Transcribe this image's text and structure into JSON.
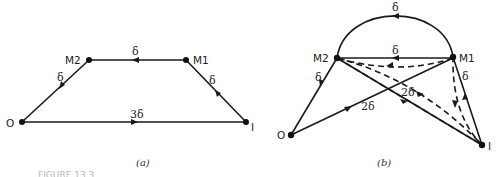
{
  "figure_caption_fragment": "FIGURE 13.3",
  "diagrams": [
    {
      "id": "a",
      "caption": "(a)",
      "nodes": {
        "M2": {
          "label": "M2"
        },
        "M1": {
          "label": "M1"
        },
        "O": {
          "label": "O"
        },
        "I": {
          "label": "I"
        }
      },
      "edges": [
        {
          "from": "M1",
          "to": "M2",
          "label": "δ",
          "style": "solid"
        },
        {
          "from": "M2",
          "to": "O",
          "label": "δ",
          "style": "solid"
        },
        {
          "from": "O",
          "to": "I",
          "label": "3δ",
          "style": "solid"
        },
        {
          "from": "I",
          "to": "M1",
          "label": "δ",
          "style": "solid"
        }
      ]
    },
    {
      "id": "b",
      "caption": "(b)",
      "nodes": {
        "M2": {
          "label": "M2"
        },
        "M1": {
          "label": "M1"
        },
        "O": {
          "label": "O"
        },
        "I": {
          "label": "I"
        }
      },
      "edges": [
        {
          "from": "M1",
          "to": "M2",
          "label": "δ",
          "style": "arc"
        },
        {
          "from": "M1",
          "to": "M2",
          "label": "δ",
          "style": "solid"
        },
        {
          "from": "M2",
          "to": "O",
          "label": "δ",
          "style": "solid"
        },
        {
          "from": "O",
          "to": "M1",
          "label": "2δ",
          "style": "solid"
        },
        {
          "from": "M2",
          "to": "I",
          "label": "2δ",
          "style": "solid"
        },
        {
          "from": "I",
          "to": "M1",
          "label": "δ",
          "style": "solid"
        },
        {
          "from": "M1",
          "to": "M2",
          "label": "",
          "style": "dashed"
        },
        {
          "from": "M2",
          "to": "I",
          "label": "",
          "style": "dashed"
        },
        {
          "from": "I",
          "to": "M1",
          "label": "",
          "style": "dashed"
        }
      ]
    }
  ]
}
